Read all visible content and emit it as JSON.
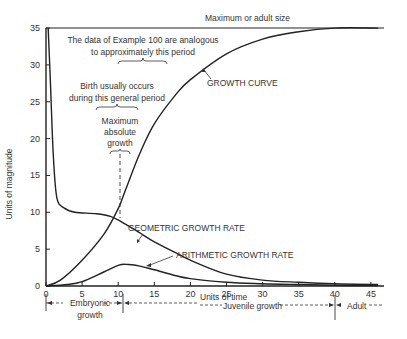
{
  "chart_data": {
    "type": "line",
    "title": "",
    "xlabel": "Units of time",
    "ylabel": "Units of magnitude",
    "xlim": [
      0,
      47
    ],
    "ylim": [
      0,
      35
    ],
    "xticks": [
      0,
      5,
      10,
      15,
      20,
      25,
      30,
      35,
      40,
      45
    ],
    "yticks": [
      0,
      5,
      10,
      15,
      20,
      25,
      30,
      35
    ],
    "grid": false,
    "series": [
      {
        "name": "GROWTH CURVE",
        "x": [
          0,
          2,
          5,
          8,
          10,
          11,
          13,
          15,
          18,
          20,
          25,
          30,
          35,
          40,
          46
        ],
        "y": [
          0,
          0.8,
          3.5,
          7.0,
          10.5,
          13,
          18,
          22,
          26,
          28,
          31.5,
          33.5,
          34.5,
          35,
          35
        ]
      },
      {
        "name": "GEOMETRIC GROWTH RATE",
        "x": [
          0.3,
          0.6,
          1.0,
          1.5,
          2.5,
          4,
          7,
          9,
          11,
          13,
          15,
          18,
          20,
          25,
          30,
          35,
          40,
          46
        ],
        "y": [
          35,
          28,
          18,
          12,
          10.6,
          10.0,
          9.8,
          9.4,
          8.4,
          7.2,
          6.0,
          4.5,
          3.5,
          1.6,
          0.8,
          0.5,
          0.3,
          0.2
        ]
      },
      {
        "name": "ARITHMETIC GROWTH RATE",
        "x": [
          0,
          3,
          5,
          8,
          10,
          11,
          13,
          15,
          18,
          20,
          25,
          30,
          35,
          40,
          46
        ],
        "y": [
          0,
          0.2,
          0.6,
          1.9,
          2.8,
          2.95,
          2.7,
          2.2,
          1.4,
          1.0,
          0.5,
          0.3,
          0.2,
          0.1,
          0.05
        ]
      }
    ],
    "reference_lines": [
      {
        "type": "horizontal",
        "y": 35,
        "label": "Maximum or adult size"
      }
    ],
    "annotations": [
      {
        "text": "The data of Example 100 are analogous to approximately this period",
        "x_range": [
          10,
          17
        ]
      },
      {
        "text": "Birth usually occurs during this general period",
        "x_range": [
          7,
          13
        ]
      },
      {
        "text": "Maximum absolute growth",
        "x": 10.5
      },
      {
        "text": "GROWTH CURVE",
        "points_to": [
          14,
          20
        ]
      },
      {
        "text": "GEOMETRIC GROWTH RATE",
        "points_to": [
          15,
          6
        ]
      },
      {
        "text": "ARITHMETIC GROWTH RATE",
        "points_to": [
          13,
          2.5
        ]
      }
    ],
    "phases": [
      {
        "label": "Embryonic growth",
        "x_range": [
          0,
          11
        ]
      },
      {
        "label": "Juvenile growth",
        "x_range": [
          11,
          40
        ]
      },
      {
        "label": "Adult",
        "x_range": [
          40,
          47
        ]
      }
    ]
  },
  "labels": {
    "max_size": "Maximum or adult size",
    "example_line1": "The data of Example 100 are analogous",
    "example_line2": "to approximately this period",
    "birth_line1": "Birth usually occurs",
    "birth_line2": "during this general period",
    "maxgrowth_line1": "Maximum",
    "maxgrowth_line2": "absolute",
    "maxgrowth_line3": "growth",
    "growth_curve": "GROWTH CURVE",
    "geometric": "GEOMETRIC GROWTH RATE",
    "arithmetic": "ARITHMETIC GROWTH RATE",
    "ylabel": "Units of magnitude",
    "xlabel": "Units of time",
    "embryonic_line1": "Embryonic",
    "embryonic_line2": "growth",
    "juvenile": "Juvenile growth",
    "adult": "Adult"
  }
}
